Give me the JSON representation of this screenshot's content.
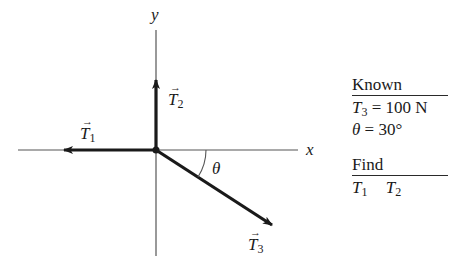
{
  "diagram": {
    "axes": {
      "x_label": "x",
      "y_label": "y",
      "origin_px": [
        156,
        150
      ]
    },
    "vectors": [
      {
        "id": "T1",
        "symbol": "T",
        "subscript": "1",
        "direction": "negative x (left)"
      },
      {
        "id": "T2",
        "symbol": "T",
        "subscript": "2",
        "direction": "positive y (up)"
      },
      {
        "id": "T3",
        "symbol": "T",
        "subscript": "3",
        "direction": "below positive x-axis at angle theta"
      }
    ],
    "angle_label": "θ",
    "vector_arrow_glyph": "→"
  },
  "known": {
    "heading": "Known",
    "items": [
      {
        "symbol": "T",
        "subscript": "3",
        "rest": " = 100 N"
      },
      {
        "symbol": "θ",
        "subscript": "",
        "rest": " = 30°"
      }
    ]
  },
  "find": {
    "heading": "Find",
    "items": [
      {
        "symbol": "T",
        "subscript": "1"
      },
      {
        "symbol": "T",
        "subscript": "2"
      }
    ]
  },
  "colors": {
    "ink": "#1a1a1a",
    "axis": "#555555",
    "background": "#ffffff"
  }
}
